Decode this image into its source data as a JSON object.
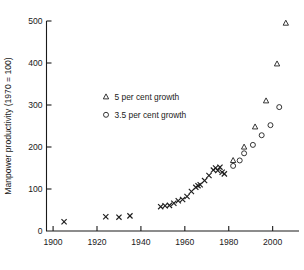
{
  "chart_data": {
    "type": "scatter",
    "title": "",
    "xlabel": "",
    "ylabel": "Manpower productivity (1970 = 100)",
    "xlim": [
      1897,
      2012
    ],
    "ylim": [
      0,
      500
    ],
    "grid": false,
    "origin_label": "0",
    "xticks": [
      1900,
      1920,
      1940,
      1960,
      1980,
      2000
    ],
    "xtick_labels": [
      "1900",
      "1920",
      "1940",
      "1960",
      "1980",
      "2000"
    ],
    "yticks": [
      100,
      200,
      300,
      400,
      500
    ],
    "ytick_labels": [
      "100",
      "200",
      "300",
      "400",
      "500"
    ],
    "legend": {
      "position": "inside-upper-left",
      "entries": [
        {
          "marker": "triangle",
          "label": "5 per cent growth"
        },
        {
          "marker": "circle",
          "label": "3.5 per cent growth"
        }
      ]
    },
    "series": [
      {
        "name": "historical",
        "marker": "x",
        "points": [
          [
            1905,
            22
          ],
          [
            1924,
            34
          ],
          [
            1930,
            33
          ],
          [
            1935,
            36
          ],
          [
            1949,
            58
          ],
          [
            1951,
            60
          ],
          [
            1953,
            61
          ],
          [
            1955,
            66
          ],
          [
            1957,
            72
          ],
          [
            1959,
            75
          ],
          [
            1961,
            82
          ],
          [
            1963,
            94
          ],
          [
            1965,
            104
          ],
          [
            1966,
            108
          ],
          [
            1967,
            110
          ],
          [
            1969,
            120
          ],
          [
            1971,
            132
          ],
          [
            1973,
            145
          ],
          [
            1974,
            150
          ],
          [
            1975,
            144
          ],
          [
            1976,
            152
          ],
          [
            1977,
            140
          ],
          [
            1978,
            136
          ]
        ]
      },
      {
        "name": "5 per cent growth",
        "marker": "triangle",
        "points": [
          [
            1982,
            168
          ],
          [
            1987,
            200
          ],
          [
            1992,
            248
          ],
          [
            1997,
            310
          ],
          [
            2002,
            398
          ],
          [
            2006,
            495
          ]
        ]
      },
      {
        "name": "3.5 per cent growth",
        "marker": "circle",
        "points": [
          [
            1982,
            155
          ],
          [
            1985,
            168
          ],
          [
            1987,
            185
          ],
          [
            1991,
            205
          ],
          [
            1995,
            228
          ],
          [
            1999,
            252
          ],
          [
            2003,
            295
          ]
        ]
      }
    ]
  }
}
